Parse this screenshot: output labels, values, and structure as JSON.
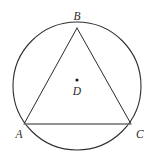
{
  "figure": {
    "kind": "circle-with-inscribed-triangle",
    "canvas": {
      "width": 153,
      "height": 165,
      "background": "#ffffff"
    },
    "colors": {
      "circle_stroke": "#2f2f2f",
      "triangle_stroke": "#2b2b2b",
      "base_stroke": "#6e6e6e",
      "label_color": "#2b2b2b",
      "center_dot": "#1c1c1c"
    },
    "circle": {
      "cx": 77,
      "cy": 86,
      "r": 64,
      "stroke_width": 1.1
    },
    "triangle": {
      "stroke_width": 1.0,
      "base_stroke_width": 1.6,
      "vertices": [
        {
          "name": "B",
          "x": 77,
          "y": 28
        },
        {
          "name": "C",
          "x": 131,
          "y": 124
        },
        {
          "name": "A",
          "x": 24,
          "y": 124
        }
      ]
    },
    "center_point": {
      "name": "D",
      "x": 77,
      "y": 80,
      "radius": 1.6
    },
    "labels": {
      "b": "B",
      "a": "A",
      "c": "C",
      "d": "D"
    }
  }
}
